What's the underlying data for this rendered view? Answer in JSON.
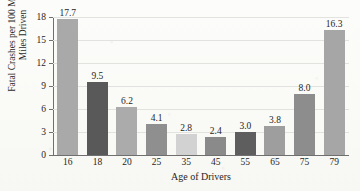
{
  "chart_data": {
    "type": "bar",
    "title": "",
    "xlabel": "Age of Drivers",
    "ylabel": "Fatal Crashes per 100 Million Miles Driven",
    "ylabel_line1": "Fatal Crashes per 100 Million",
    "ylabel_line2": "Miles Driven",
    "categories": [
      "16",
      "18",
      "20",
      "25",
      "35",
      "45",
      "55",
      "65",
      "75",
      "79"
    ],
    "values": [
      17.7,
      9.5,
      6.2,
      4.1,
      2.8,
      2.4,
      3.0,
      3.8,
      8.0,
      16.3
    ],
    "value_labels": [
      "17.7",
      "9.5",
      "6.2",
      "4.1",
      "2.8",
      "2.4",
      "3.0",
      "3.8",
      "8.0",
      "16.3"
    ],
    "bar_colors": [
      "#a9a9a9",
      "#595959",
      "#ababab",
      "#8f8f8f",
      "#d2d2d2",
      "#8a8a8a",
      "#5e5e5e",
      "#9e9e9e",
      "#8d8d8d",
      "#a6a6a6"
    ],
    "ylim": [
      0,
      18
    ],
    "yticks": [
      0,
      3,
      6,
      9,
      12,
      15,
      18
    ],
    "ytick_labels": [
      "0",
      "3",
      "6",
      "9",
      "12",
      "15",
      "18"
    ],
    "grid": true,
    "grid_color": "#e2e2de",
    "axis_color": "#6f6f6f",
    "legend": null,
    "legend_position": "none",
    "background_color": "#fbfbf8"
  },
  "ghost_title": ""
}
